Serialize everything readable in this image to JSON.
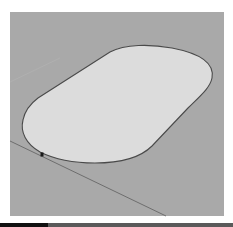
{
  "viewport": {
    "background": "#a9a9a9",
    "face_fill": "#dcdcdc",
    "edge_color": "#4a4a4a",
    "axis_color": "#6e6e6e",
    "shape": "rounded-rectangle-face",
    "inference_point": {
      "x": 42,
      "y": 155
    }
  },
  "bottom_bar": {
    "left_color": "#111111",
    "right_color": "#5a5a5a"
  }
}
